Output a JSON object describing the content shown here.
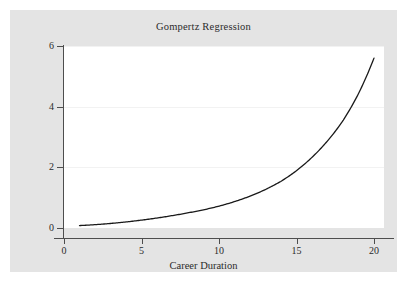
{
  "figure": {
    "background_color": "#ffffff",
    "panel_color": "#e4e4e4",
    "plot_area_color": "#ffffff",
    "axis_color": "#4d4d4d",
    "gridline_color": "#f2f2f2",
    "curve_color": "#1a1a1a"
  },
  "chart_data": {
    "type": "line",
    "title": "Gompertz Regression",
    "xlabel": "Career Duration",
    "ylabel": "",
    "xlim": [
      0,
      20.6
    ],
    "ylim": [
      0,
      6.2
    ],
    "xticks": [
      0,
      5,
      10,
      15,
      20
    ],
    "xtick_labels": [
      "0",
      "5",
      "10",
      "15",
      "20"
    ],
    "yticks": [
      0,
      2,
      4,
      6
    ],
    "ytick_labels": [
      "0",
      "2",
      "4",
      "6"
    ],
    "grid": "horizontal",
    "legend": "none",
    "series": [
      {
        "name": "Gompertz fit",
        "color": "#1a1a1a",
        "x": [
          1,
          2,
          3,
          4,
          5,
          6,
          7,
          8,
          9,
          10,
          11,
          12,
          13,
          14,
          15,
          16,
          17,
          18,
          19,
          20
        ],
        "values": [
          0.08,
          0.11,
          0.15,
          0.2,
          0.26,
          0.33,
          0.41,
          0.5,
          0.6,
          0.72,
          0.87,
          1.05,
          1.27,
          1.54,
          1.89,
          2.33,
          2.87,
          3.54,
          4.43,
          5.6
        ]
      }
    ]
  }
}
